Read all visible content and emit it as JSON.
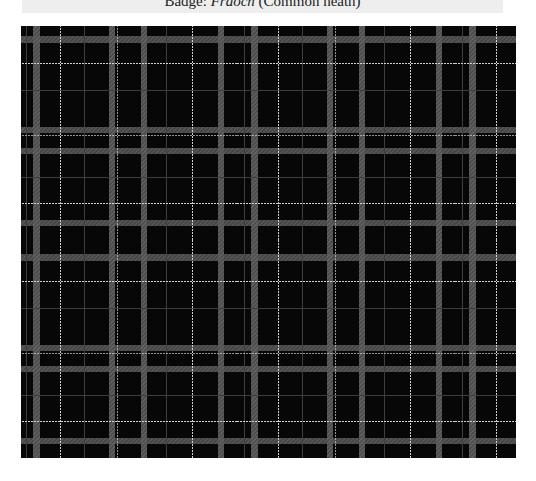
{
  "caption": {
    "prefix": "Badge: ",
    "name_italic": "Fraoch",
    "suffix": " (Common heath)"
  },
  "tartan": {
    "sett_size_px": 218,
    "colors": {
      "ground": "#070707",
      "grey_band": "#5a5a5a",
      "thin_grey": "#3d3d3d",
      "white_line": "#d0d0d0"
    },
    "grey_bands": [
      17,
      92,
      104,
      201,
      209
    ],
    "thin_grey_lines": [
      67,
      148,
      225
    ],
    "white_lines": [
      8,
      42,
      99,
      174,
      187
    ]
  }
}
